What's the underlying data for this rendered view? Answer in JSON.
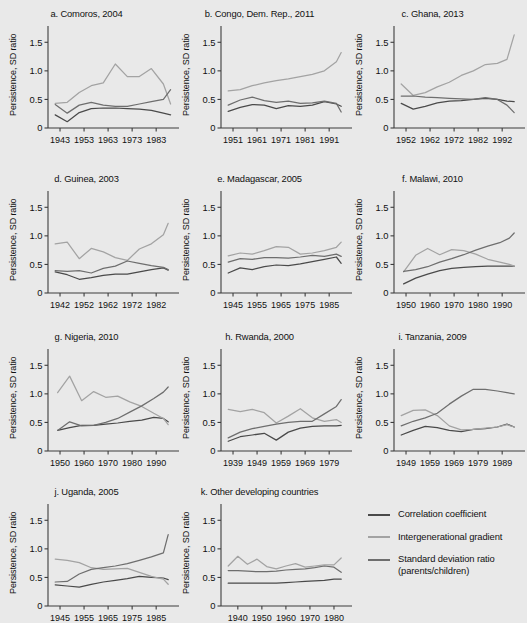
{
  "chart_data": {
    "type": "line",
    "title": "",
    "ylabel": "Persistence, SD ratio",
    "xlabel": "",
    "ylim": [
      0,
      1.75
    ],
    "yticks": [
      0,
      0.5,
      1.0,
      1.5
    ],
    "yticklabels": [
      "0",
      "0.5",
      "1.0",
      "1.5"
    ],
    "grid": false,
    "legend_position": "bottom-right",
    "series_names": [
      "Correlation coefficient",
      "Intergenerational gradient",
      "Standard deviation ratio (parents/children)"
    ],
    "series_colors": [
      "#4a4a4a",
      "#a3a3a3",
      "#6e6e6e"
    ],
    "panels": [
      {
        "key": "comoros",
        "title": "a. Comoros, 2004",
        "xlim": [
          1938,
          1990
        ],
        "xticks": [
          1943,
          1953,
          1963,
          1973,
          1983
        ],
        "xticklabels": [
          "1943",
          "1953",
          "1963",
          "1973",
          "1983"
        ],
        "x": [
          1941,
          1946,
          1951,
          1956,
          1961,
          1966,
          1971,
          1976,
          1981,
          1986,
          1989
        ],
        "series": [
          {
            "name": "Correlation coefficient",
            "values": [
              0.23,
              0.11,
              0.27,
              0.34,
              0.35,
              0.35,
              0.34,
              0.33,
              0.31,
              0.26,
              0.23
            ]
          },
          {
            "name": "Intergenerational gradient",
            "values": [
              0.43,
              0.45,
              0.62,
              0.74,
              0.79,
              1.12,
              0.9,
              0.9,
              1.04,
              0.77,
              0.42
            ]
          },
          {
            "name": "Standard deviation ratio (parents/children)",
            "values": [
              0.41,
              0.26,
              0.4,
              0.45,
              0.4,
              0.38,
              0.38,
              0.42,
              0.46,
              0.5,
              0.67
            ]
          }
        ]
      },
      {
        "key": "congo",
        "title": "b. Congo, Dem. Rep., 2011",
        "xlim": [
          1946,
          1998
        ],
        "xticks": [
          1951,
          1961,
          1971,
          1981,
          1991
        ],
        "xticklabels": [
          "1951",
          "1961",
          "1971",
          "1981",
          "1991"
        ],
        "x": [
          1949,
          1954,
          1959,
          1964,
          1969,
          1974,
          1979,
          1984,
          1989,
          1994,
          1996
        ],
        "series": [
          {
            "name": "Correlation coefficient",
            "values": [
              0.29,
              0.36,
              0.41,
              0.4,
              0.34,
              0.39,
              0.38,
              0.4,
              0.46,
              0.42,
              0.38
            ]
          },
          {
            "name": "Intergenerational gradient",
            "values": [
              0.65,
              0.67,
              0.74,
              0.79,
              0.83,
              0.86,
              0.9,
              0.94,
              1.0,
              1.16,
              1.32
            ]
          },
          {
            "name": "Standard deviation ratio (parents/children)",
            "values": [
              0.4,
              0.49,
              0.54,
              0.48,
              0.45,
              0.47,
              0.43,
              0.44,
              0.47,
              0.43,
              0.28
            ]
          }
        ]
      },
      {
        "key": "ghana",
        "title": "c. Ghana, 2013",
        "xlim": [
          1947,
          1999
        ],
        "xticks": [
          1952,
          1962,
          1972,
          1982,
          1992
        ],
        "xticklabels": [
          "1952",
          "1962",
          "1972",
          "1982",
          "1992"
        ],
        "x": [
          1950,
          1955,
          1960,
          1965,
          1970,
          1975,
          1980,
          1985,
          1990,
          1994,
          1997
        ],
        "series": [
          {
            "name": "Correlation coefficient",
            "values": [
              0.43,
              0.33,
              0.38,
              0.44,
              0.47,
              0.48,
              0.5,
              0.52,
              0.5,
              0.47,
              0.46
            ]
          },
          {
            "name": "Intergenerational gradient",
            "values": [
              0.77,
              0.57,
              0.62,
              0.72,
              0.8,
              0.92,
              1.0,
              1.11,
              1.13,
              1.2,
              1.63
            ]
          },
          {
            "name": "Standard deviation ratio (parents/children)",
            "values": [
              0.56,
              0.56,
              0.54,
              0.53,
              0.52,
              0.51,
              0.5,
              0.53,
              0.5,
              0.4,
              0.27
            ]
          }
        ]
      },
      {
        "key": "guinea",
        "title": "d. Guinea, 2003",
        "xlim": [
          1937,
          1989
        ],
        "xticks": [
          1942,
          1952,
          1962,
          1972,
          1982
        ],
        "xticklabels": [
          "1942",
          "1952",
          "1962",
          "1972",
          "1982"
        ],
        "x": [
          1940,
          1945,
          1950,
          1955,
          1960,
          1965,
          1970,
          1975,
          1980,
          1985,
          1987
        ],
        "series": [
          {
            "name": "Correlation coefficient",
            "values": [
              0.37,
              0.32,
              0.24,
              0.27,
              0.31,
              0.33,
              0.33,
              0.37,
              0.41,
              0.44,
              0.4
            ]
          },
          {
            "name": "Intergenerational gradient",
            "values": [
              0.86,
              0.89,
              0.6,
              0.78,
              0.72,
              0.62,
              0.57,
              0.77,
              0.86,
              1.02,
              1.22
            ]
          },
          {
            "name": "Standard deviation ratio (parents/children)",
            "values": [
              0.39,
              0.38,
              0.39,
              0.35,
              0.43,
              0.47,
              0.56,
              0.52,
              0.48,
              0.45,
              0.41
            ]
          }
        ]
      },
      {
        "key": "madagascar",
        "title": "e. Madagascar, 2005",
        "xlim": [
          1940,
          1992
        ],
        "xticks": [
          1945,
          1955,
          1965,
          1975,
          1985
        ],
        "xticklabels": [
          "1945",
          "1955",
          "1965",
          "1975",
          "1985"
        ],
        "x": [
          1943,
          1948,
          1953,
          1958,
          1963,
          1968,
          1973,
          1978,
          1983,
          1988,
          1990
        ],
        "series": [
          {
            "name": "Correlation coefficient",
            "values": [
              0.35,
              0.44,
              0.41,
              0.46,
              0.49,
              0.48,
              0.51,
              0.55,
              0.59,
              0.63,
              0.52
            ]
          },
          {
            "name": "Intergenerational gradient",
            "values": [
              0.65,
              0.7,
              0.68,
              0.74,
              0.81,
              0.8,
              0.68,
              0.7,
              0.74,
              0.8,
              0.89
            ]
          },
          {
            "name": "Standard deviation ratio (parents/children)",
            "values": [
              0.54,
              0.6,
              0.59,
              0.62,
              0.62,
              0.61,
              0.63,
              0.66,
              0.64,
              0.68,
              0.64
            ]
          }
        ]
      },
      {
        "key": "malawi",
        "title": "f. Malawi, 2010",
        "xlim": [
          1945,
          1997
        ],
        "xticks": [
          1950,
          1960,
          1970,
          1980,
          1990
        ],
        "xticklabels": [
          "1950",
          "1960",
          "1970",
          "1980",
          "1990"
        ],
        "x": [
          1949,
          1954,
          1959,
          1964,
          1969,
          1974,
          1979,
          1984,
          1989,
          1993,
          1995
        ],
        "series": [
          {
            "name": "Correlation coefficient",
            "values": [
              0.16,
              0.26,
              0.33,
              0.39,
              0.43,
              0.45,
              0.46,
              0.47,
              0.47,
              0.47,
              0.47
            ]
          },
          {
            "name": "Intergenerational gradient",
            "values": [
              0.37,
              0.66,
              0.78,
              0.67,
              0.76,
              0.74,
              0.68,
              0.59,
              0.54,
              0.5,
              0.47
            ]
          },
          {
            "name": "Standard deviation ratio (parents/children)",
            "values": [
              0.38,
              0.41,
              0.46,
              0.54,
              0.6,
              0.67,
              0.75,
              0.82,
              0.88,
              0.96,
              1.05
            ]
          }
        ]
      },
      {
        "key": "nigeria",
        "title": "g. Nigeria, 2010",
        "xlim": [
          1945,
          1997
        ],
        "xticks": [
          1950,
          1960,
          1970,
          1980,
          1990
        ],
        "xticklabels": [
          "1950",
          "1960",
          "1970",
          "1980",
          "1990"
        ],
        "x": [
          1949,
          1954,
          1959,
          1964,
          1969,
          1974,
          1979,
          1984,
          1989,
          1993,
          1995
        ],
        "series": [
          {
            "name": "Correlation coefficient",
            "values": [
              0.36,
              0.41,
              0.45,
              0.45,
              0.47,
              0.49,
              0.52,
              0.54,
              0.59,
              0.57,
              0.51
            ]
          },
          {
            "name": "Intergenerational gradient",
            "values": [
              1.02,
              1.31,
              0.88,
              1.04,
              0.94,
              0.96,
              0.86,
              0.78,
              0.66,
              0.57,
              0.46
            ]
          },
          {
            "name": "Standard deviation ratio (parents/children)",
            "values": [
              0.36,
              0.51,
              0.44,
              0.45,
              0.5,
              0.57,
              0.68,
              0.79,
              0.92,
              1.03,
              1.12
            ]
          }
        ]
      },
      {
        "key": "rwanda",
        "title": "h. Rwanda, 2000",
        "xlim": [
          1934,
          1986
        ],
        "xticks": [
          1939,
          1949,
          1959,
          1969,
          1979
        ],
        "xticklabels": [
          "1939",
          "1949",
          "1959",
          "1969",
          "1979"
        ],
        "x": [
          1937,
          1942,
          1947,
          1952,
          1957,
          1962,
          1967,
          1972,
          1977,
          1982,
          1984
        ],
        "series": [
          {
            "name": "Correlation coefficient",
            "values": [
              0.17,
              0.25,
              0.28,
              0.31,
              0.19,
              0.33,
              0.4,
              0.43,
              0.44,
              0.44,
              0.45
            ]
          },
          {
            "name": "Intergenerational gradient",
            "values": [
              0.73,
              0.69,
              0.73,
              0.67,
              0.49,
              0.61,
              0.74,
              0.58,
              0.52,
              0.55,
              0.5
            ]
          },
          {
            "name": "Standard deviation ratio (parents/children)",
            "values": [
              0.23,
              0.33,
              0.39,
              0.43,
              0.47,
              0.5,
              0.52,
              0.52,
              0.65,
              0.78,
              0.9
            ]
          }
        ]
      },
      {
        "key": "tanzania",
        "title": "i. Tanzania, 2009",
        "xlim": [
          1944,
          1996
        ],
        "xticks": [
          1949,
          1959,
          1969,
          1979,
          1989
        ],
        "xticklabels": [
          "1949",
          "1959",
          "1969",
          "1979",
          "1989"
        ],
        "x": [
          1947,
          1952,
          1957,
          1962,
          1967,
          1972,
          1977,
          1982,
          1987,
          1991,
          1994
        ],
        "series": [
          {
            "name": "Correlation coefficient",
            "values": [
              0.28,
              0.36,
              0.43,
              0.41,
              0.36,
              0.34,
              0.38,
              0.39,
              0.42,
              0.47,
              0.42
            ]
          },
          {
            "name": "Intergenerational gradient",
            "values": [
              0.62,
              0.71,
              0.72,
              0.62,
              0.44,
              0.37,
              0.38,
              0.4,
              0.42,
              0.46,
              0.42
            ]
          },
          {
            "name": "Standard deviation ratio (parents/children)",
            "values": [
              0.44,
              0.52,
              0.58,
              0.66,
              0.82,
              0.96,
              1.08,
              1.08,
              1.05,
              1.02,
              1.0
            ]
          }
        ]
      },
      {
        "key": "uganda",
        "title": "j. Uganda, 2005",
        "xlim": [
          1940,
          1992
        ],
        "xticks": [
          1945,
          1955,
          1965,
          1975,
          1985
        ],
        "xticklabels": [
          "1945",
          "1955",
          "1965",
          "1975",
          "1985"
        ],
        "x": [
          1943,
          1948,
          1953,
          1958,
          1963,
          1968,
          1973,
          1978,
          1983,
          1988,
          1990
        ],
        "series": [
          {
            "name": "Correlation coefficient",
            "values": [
              0.37,
              0.35,
              0.33,
              0.38,
              0.42,
              0.45,
              0.48,
              0.52,
              0.5,
              0.49,
              0.46
            ]
          },
          {
            "name": "Intergenerational gradient",
            "values": [
              0.82,
              0.8,
              0.76,
              0.67,
              0.64,
              0.65,
              0.66,
              0.59,
              0.52,
              0.47,
              0.38
            ]
          },
          {
            "name": "Standard deviation ratio (parents/children)",
            "values": [
              0.42,
              0.43,
              0.56,
              0.64,
              0.67,
              0.7,
              0.74,
              0.8,
              0.86,
              0.93,
              1.25
            ]
          }
        ]
      },
      {
        "key": "other",
        "title": "k. Other developing countries",
        "xlim": [
          1933,
          1985
        ],
        "xticks": [
          1940,
          1950,
          1960,
          1970,
          1980
        ],
        "xticklabels": [
          "1940",
          "1950",
          "1960",
          "1970",
          "1980"
        ],
        "x": [
          1936,
          1940,
          1944,
          1948,
          1952,
          1956,
          1960,
          1964,
          1968,
          1972,
          1976,
          1980,
          1983
        ],
        "series": [
          {
            "name": "Correlation coefficient",
            "values": [
              0.4,
              0.4,
              0.4,
              0.4,
              0.4,
              0.4,
              0.41,
              0.42,
              0.43,
              0.44,
              0.45,
              0.47,
              0.47
            ]
          },
          {
            "name": "Intergenerational gradient",
            "values": [
              0.7,
              0.87,
              0.73,
              0.82,
              0.69,
              0.65,
              0.7,
              0.74,
              0.68,
              0.7,
              0.72,
              0.72,
              0.84
            ]
          },
          {
            "name": "Standard deviation ratio (parents/children)",
            "values": [
              0.62,
              0.62,
              0.61,
              0.6,
              0.6,
              0.61,
              0.63,
              0.64,
              0.65,
              0.67,
              0.7,
              0.68,
              0.59
            ]
          }
        ]
      }
    ]
  },
  "legend": {
    "items": [
      {
        "label": "Correlation coefficient",
        "sublabel": "",
        "color": "#4a4a4a"
      },
      {
        "label": "Intergenerational gradient",
        "sublabel": "",
        "color": "#a3a3a3"
      },
      {
        "label": "Standard deviation ratio",
        "sublabel": "(parents/children)",
        "color": "#6e6e6e"
      }
    ]
  }
}
